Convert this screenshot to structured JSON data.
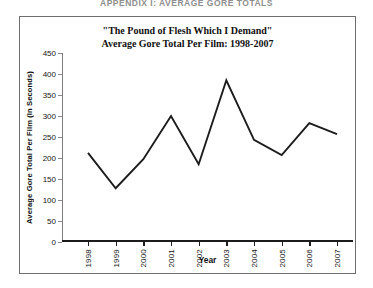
{
  "page": {
    "appendix_heading": "APPENDIX I: AVERAGE GORE TOTALS"
  },
  "figure": {
    "title_line1": "\"The Pound of Flesh Which I Demand\"",
    "title_line2": "Average Gore Total Per Film: 1998-2007",
    "border_color": "#6e6e6e"
  },
  "chart_data": {
    "type": "line",
    "title": "\"The Pound of Flesh Which I Demand\" Average Gore Total Per Film: 1998-2007",
    "subtitle": "Average Gore Total Per Film: 1998-2007",
    "xlabel": "Year",
    "ylabel": "Average Gore Total Per Film (In Seconds)",
    "categories": [
      "1998",
      "1999",
      "2000",
      "2001",
      "2002",
      "2003",
      "2004",
      "2005",
      "2006",
      "2007"
    ],
    "values": [
      212,
      128,
      197,
      300,
      185,
      385,
      243,
      207,
      283,
      257
    ],
    "series": [
      {
        "name": "Average Gore Total Per Film",
        "values": [
          212,
          128,
          197,
          300,
          185,
          385,
          243,
          207,
          283,
          257
        ],
        "color": "#1c1c1c"
      }
    ],
    "ylim": [
      0,
      450
    ],
    "yticks": [
      0,
      50,
      100,
      150,
      200,
      250,
      300,
      350,
      400,
      450
    ],
    "ytick_labels": [
      "0",
      "50",
      "100",
      "150",
      "200",
      "250",
      "300",
      "350",
      "400",
      "450"
    ],
    "xtick_labels": [
      "1998",
      "1999",
      "2000",
      "2001",
      "2002",
      "2003",
      "2004",
      "2005",
      "2006",
      "2007"
    ],
    "grid": false,
    "legend": false,
    "legend_position": "none",
    "line_color": "#1c1c1c",
    "markers": false
  }
}
